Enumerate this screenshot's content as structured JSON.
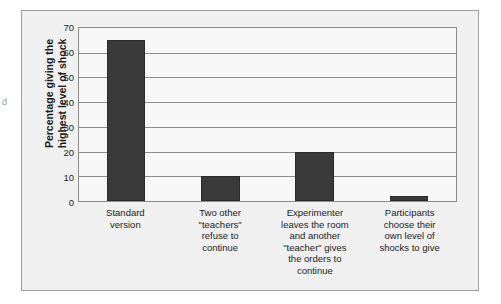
{
  "margin_artifact": "d",
  "chart_data": {
    "type": "bar",
    "title": "",
    "xlabel": "",
    "ylabel": "Percentage giving the\nhighest level of shock",
    "ylim": [
      0,
      70
    ],
    "yticks": [
      0,
      10,
      20,
      30,
      40,
      50,
      60,
      70
    ],
    "ytick_labels": [
      "0",
      "10",
      "20",
      "30",
      "40",
      "50",
      "60",
      "70"
    ],
    "grid": true,
    "legend": "none",
    "bar_color": "#3a3a3a",
    "categories": [
      "Standard\nversion",
      "Two other\n\"teachers\"\nrefuse to\ncontinue",
      "Experimenter\nleaves the room\nand another\n\"teacher\" gives\nthe orders to\ncontinue",
      "Participants\nchoose their\nown level of\nshocks to give"
    ],
    "values": [
      65,
      10,
      20,
      2
    ]
  }
}
